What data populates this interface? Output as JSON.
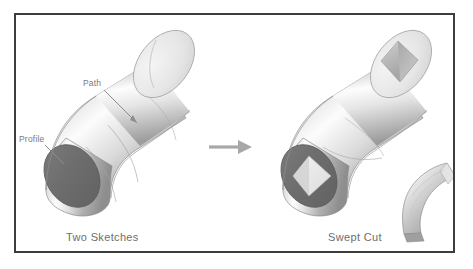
{
  "figure": {
    "type": "cad-illustration",
    "topic": "Swept Cut",
    "border_color": "#3d3d3d",
    "background_color": "#ffffff"
  },
  "panels": {
    "left": {
      "caption": "Two Sketches",
      "annotations": [
        {
          "id": "path",
          "label": "Path",
          "points_to": "tube-centerline-curve"
        },
        {
          "id": "profile",
          "label": "Profile",
          "points_to": "circular-end-face"
        }
      ],
      "solid": {
        "name": "elbow-tube",
        "end_face_color": "#6f6f6f",
        "top_face_color": "#e8e8e8",
        "body_highlight": "#fefefe",
        "body_shadow": "#8f8f8f"
      }
    },
    "right": {
      "caption": "Swept Cut",
      "solid": {
        "name": "elbow-tube-cut",
        "cut_shape": "diamond",
        "end_face_color": "#6f6f6f",
        "hole_face_color": "#ededed",
        "top_face_color": "#ededed"
      },
      "offcut": {
        "name": "removed-swept-material",
        "shape": "curved-diamond-sweep"
      }
    }
  },
  "transition": {
    "name": "process-arrow",
    "direction": "right",
    "color": "#a8a8a8"
  },
  "icons": {
    "arrow_right": "→"
  },
  "colors": {
    "text": "#6e6e6e",
    "leader_text": "#7a7a7a",
    "metal_light": "#fdfdfd",
    "metal_mid": "#c9c9c9",
    "metal_dark": "#8a8a8a",
    "end_face": "#6f6f6f"
  }
}
